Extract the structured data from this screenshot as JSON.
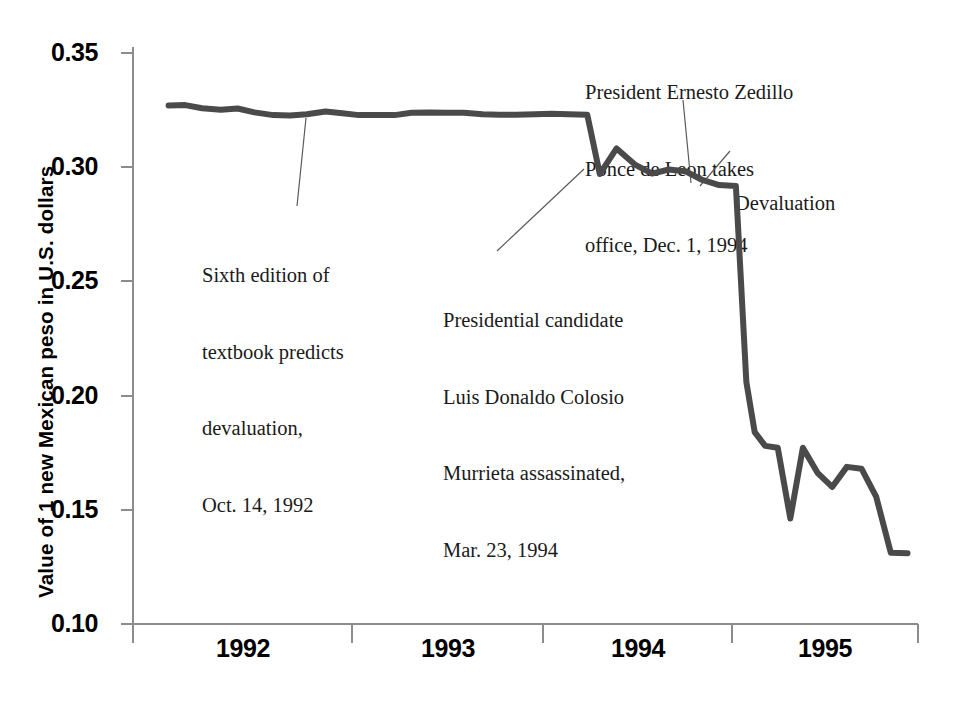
{
  "chart_data": {
    "type": "line",
    "title": "",
    "xlabel": "",
    "ylabel": "Value of 1 new Mexican peso in U.S. dollars",
    "ylim": [
      0.1,
      0.35
    ],
    "ytick_labels": [
      "0.35",
      "0.30",
      "0.25",
      "0.20",
      "0.15",
      "0.10"
    ],
    "ytick_values": [
      0.35,
      0.3,
      0.25,
      0.2,
      0.15,
      0.1
    ],
    "xtick_labels": [
      "1992",
      "1993",
      "1994",
      "1995"
    ],
    "xlim": [
      1992.0,
      1995.75
    ],
    "grid": false,
    "legend": "none",
    "series": [
      {
        "name": "Mexican peso value",
        "color": "#4a4a4a",
        "x": [
          1992.17,
          1992.25,
          1992.33,
          1992.42,
          1992.5,
          1992.58,
          1992.67,
          1992.75,
          1992.83,
          1992.92,
          1993.0,
          1993.08,
          1993.17,
          1993.25,
          1993.33,
          1993.42,
          1993.5,
          1993.58,
          1993.67,
          1993.75,
          1993.83,
          1993.92,
          1994.0,
          1994.08,
          1994.17,
          1994.23,
          1994.31,
          1994.4,
          1994.48,
          1994.56,
          1994.64,
          1994.72,
          1994.8,
          1994.88,
          1994.93,
          1994.97,
          1995.02,
          1995.08,
          1995.14,
          1995.2,
          1995.27,
          1995.34,
          1995.41,
          1995.48,
          1995.55,
          1995.62,
          1995.7
        ],
        "y": [
          0.327,
          0.3272,
          0.3258,
          0.3252,
          0.3257,
          0.324,
          0.3228,
          0.3226,
          0.3232,
          0.3244,
          0.3236,
          0.3228,
          0.3228,
          0.3228,
          0.3238,
          0.324,
          0.3238,
          0.3238,
          0.3232,
          0.323,
          0.323,
          0.3232,
          0.3234,
          0.3232,
          0.323,
          0.297,
          0.3082,
          0.301,
          0.2972,
          0.299,
          0.2982,
          0.2944,
          0.2922,
          0.2918,
          0.206,
          0.184,
          0.178,
          0.1772,
          0.1462,
          0.1772,
          0.1662,
          0.16,
          0.1688,
          0.168,
          0.1558,
          0.1312,
          0.131
        ]
      }
    ],
    "annotations": [
      {
        "id": "textbook-prediction",
        "lines": [
          "Sixth edition of",
          "textbook predicts",
          "devaluation,",
          "Oct. 14, 1992"
        ],
        "text": "Sixth edition of textbook predicts devaluation, Oct. 14, 1992"
      },
      {
        "id": "colosio-assassination",
        "lines": [
          "Presidential candidate",
          "Luis Donaldo Colosio",
          "Murrieta assassinated,",
          "Mar. 23, 1994"
        ],
        "text": "Presidential candidate Luis Donaldo Colosio Murrieta assassinated, Mar. 23, 1994"
      },
      {
        "id": "zedillo-takes-office",
        "lines": [
          "President Ernesto Zedillo",
          "Ponce de Leon takes",
          "office, Dec. 1, 1994"
        ],
        "text": "President Ernesto Zedillo Ponce de Leon takes office, Dec. 1, 1994"
      },
      {
        "id": "devaluation",
        "lines": [
          "Devaluation"
        ],
        "text": "Devaluation"
      }
    ]
  },
  "axis": {
    "y_title": "Value of 1 new Mexican peso in U.S. dollars",
    "y_labels": {
      "t0": "0.35",
      "t1": "0.30",
      "t2": "0.25",
      "t3": "0.20",
      "t4": "0.15",
      "t5": "0.10"
    },
    "x_labels": {
      "y1992": "1992",
      "y1993": "1993",
      "y1994": "1994",
      "y1995": "1995"
    }
  },
  "annotation_text": {
    "textbook": {
      "l1": "Sixth edition of",
      "l2": "textbook predicts",
      "l3": "devaluation,",
      "l4": "Oct. 14, 1992"
    },
    "colosio": {
      "l1": "Presidential candidate",
      "l2": "Luis Donaldo Colosio",
      "l3": "Murrieta assassinated,",
      "l4": "Mar. 23, 1994"
    },
    "zedillo": {
      "l1": "President Ernesto Zedillo",
      "l2": "Ponce de Leon takes",
      "l3": "office, Dec. 1, 1994"
    },
    "devaluation": {
      "l1": "Devaluation"
    }
  },
  "colors": {
    "line": "#4a4a4a",
    "axis": "#8c8c8c",
    "text": "#000000",
    "annotation_text": "#1a1a1a",
    "background": "#ffffff"
  }
}
